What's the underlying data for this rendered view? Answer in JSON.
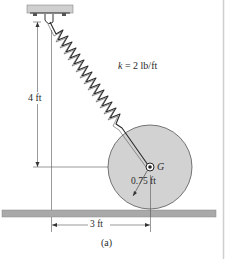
{
  "figure": {
    "caption": "(a)",
    "spring_label": {
      "symbol": "k",
      "equals": "= 2 lb/ft"
    },
    "height_dimension": "4 ft",
    "horizontal_dimension": "3 ft",
    "radius_dimension": "0.75 ft",
    "center_label": "G"
  },
  "colors": {
    "wheel_fill": "#d2d2d2",
    "ground_fill": "#a9a9a9",
    "ceiling_fill": "#cfcfcf",
    "line": "#333333"
  }
}
